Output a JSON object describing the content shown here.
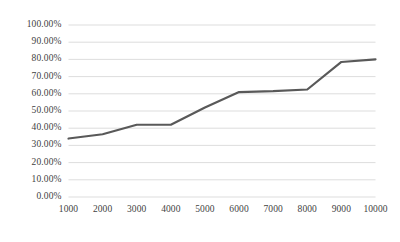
{
  "chart_data": {
    "type": "line",
    "title": "",
    "subtitle": "",
    "xlabel": "",
    "ylabel": "",
    "x": [
      1000,
      2000,
      3000,
      4000,
      5000,
      6000,
      7000,
      8000,
      9000,
      10000
    ],
    "categories": [
      "1000",
      "2000",
      "3000",
      "4000",
      "5000",
      "6000",
      "7000",
      "8000",
      "9000",
      "10000"
    ],
    "values": [
      0.34,
      0.365,
      0.42,
      0.42,
      0.52,
      0.61,
      0.615,
      0.625,
      0.785,
      0.8
    ],
    "series": [
      {
        "name": "",
        "color": "#595959",
        "values": [
          0.34,
          0.365,
          0.42,
          0.42,
          0.52,
          0.61,
          0.615,
          0.625,
          0.785,
          0.8
        ]
      }
    ],
    "ylim": [
      0.0,
      1.0
    ],
    "xlim": [
      1000,
      10000
    ],
    "y_tick_values": [
      0.0,
      0.1,
      0.2,
      0.3,
      0.4,
      0.5,
      0.6,
      0.7,
      0.8,
      0.9,
      1.0
    ],
    "y_tick_labels": [
      "0.00%",
      "10.00%",
      "20.00%",
      "30.00%",
      "40.00%",
      "50.00%",
      "60.00%",
      "70.00%",
      "80.00%",
      "90.00%",
      "100.00%"
    ],
    "x_tick_labels": [
      "1000",
      "2000",
      "3000",
      "4000",
      "5000",
      "6000",
      "7000",
      "8000",
      "9000",
      "10000"
    ],
    "grid": {
      "horizontal": true,
      "vertical": false,
      "color": "#d9d9d9"
    },
    "legend": {
      "visible": false,
      "position": "none",
      "entries": []
    },
    "line_color": "#595959",
    "line_width": 2.2,
    "markers": false,
    "background_color": "#ffffff",
    "axis_label_color": "#3f3f3f"
  }
}
